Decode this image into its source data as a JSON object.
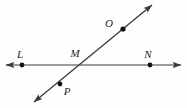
{
  "figure": {
    "kind": "geometry-diagram",
    "background_color": "#fefefe",
    "line_color": "#3a3a3a",
    "point_color": "#111111",
    "label_color": "#1f1f1f",
    "lines": [
      {
        "name": "horizontal-line-LN",
        "from_x": 6,
        "from_y": 65,
        "to_x": 181,
        "to_y": 65,
        "arrow_start": true,
        "arrow_end": true
      },
      {
        "name": "diagonal-line-PO",
        "from_x": 34,
        "from_y": 102,
        "to_x": 152,
        "to_y": 5,
        "arrow_start": true,
        "arrow_end": true
      }
    ],
    "points": [
      {
        "id": "L",
        "label": "L",
        "x": 22,
        "y": 65,
        "label_x": 20,
        "label_y": 58
      },
      {
        "id": "M",
        "label": "M",
        "x": 78,
        "y": 65,
        "label_x": 75,
        "label_y": 57
      },
      {
        "id": "N",
        "label": "N",
        "x": 150,
        "y": 65,
        "label_x": 148,
        "label_y": 58
      },
      {
        "id": "O",
        "label": "O",
        "x": 123,
        "y": 29,
        "label_x": 109,
        "label_y": 27
      },
      {
        "id": "P",
        "label": "P",
        "x": 60,
        "y": 84,
        "label_x": 67,
        "label_y": 95
      }
    ]
  }
}
